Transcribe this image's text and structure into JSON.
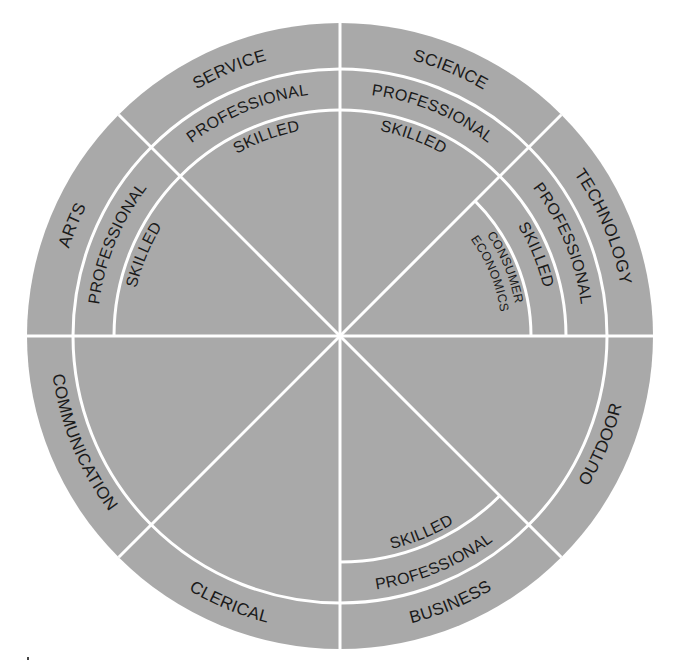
{
  "diagram": {
    "type": "career-wheel",
    "colors": {
      "fill": "#a9a9a9",
      "lines": "#ffffff",
      "text": "#1a1a1a"
    },
    "sectors": [
      {
        "id": "technology",
        "name": "TECHNOLOGY",
        "levels": [
          "PROFESSIONAL",
          "SKILLED",
          "CONSUMER",
          "ECONOMICS"
        ]
      },
      {
        "id": "science",
        "name": "SCIENCE",
        "levels": [
          "PROFESSIONAL",
          "SKILLED"
        ]
      },
      {
        "id": "service",
        "name": "SERVICE",
        "levels": [
          "PROFESSIONAL",
          "SKILLED"
        ]
      },
      {
        "id": "arts",
        "name": "ARTS",
        "levels": [
          "PROFESSIONAL",
          "SKILLED"
        ]
      },
      {
        "id": "communication",
        "name": "COMMUNICATION",
        "levels": []
      },
      {
        "id": "clerical",
        "name": "CLERICAL",
        "levels": []
      },
      {
        "id": "business",
        "name": "BUSINESS",
        "levels": [
          "PROFESSIONAL",
          "SKILLED"
        ]
      },
      {
        "id": "outdoor",
        "name": "OUTDOOR",
        "levels": []
      }
    ]
  }
}
